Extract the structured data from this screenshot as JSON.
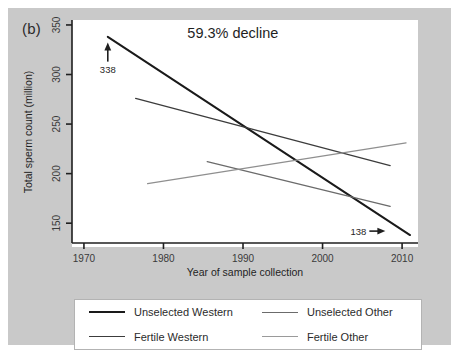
{
  "figure": {
    "panel_label": "(b)",
    "background_color": "#c9c9c9",
    "plot_background_color": "#ffffff"
  },
  "chart_data": {
    "type": "line",
    "title": "",
    "subtitle": "",
    "xlabel": "Year of sample collection",
    "ylabel": "Total sperm count (million)",
    "xlim": [
      1968.5,
      2012.0
    ],
    "ylim": [
      130,
      355
    ],
    "xticks": [
      1970,
      1980,
      1990,
      2000,
      2010
    ],
    "xtick_labels": [
      "1970",
      "1980",
      "1990",
      "2000",
      "2010"
    ],
    "yticks": [
      150,
      200,
      250,
      300,
      350
    ],
    "ytick_labels": [
      "150",
      "200",
      "250",
      "300",
      "350"
    ],
    "grid": false,
    "legend_position": "below-plot",
    "series": [
      {
        "name": "Unselected Western",
        "color": "#1a1a1a",
        "width": 2.0,
        "x": [
          1973.0,
          2011.0
        ],
        "y": [
          338,
          138
        ]
      },
      {
        "name": "Fertile Western",
        "color": "#3c3c3c",
        "width": 1.3,
        "x": [
          1976.5,
          2008.5
        ],
        "y": [
          276,
          208
        ]
      },
      {
        "name": "Unselected Other",
        "color": "#6b6b6b",
        "width": 1.3,
        "x": [
          1985.5,
          2008.5
        ],
        "y": [
          212,
          167
        ]
      },
      {
        "name": "Fertile Other",
        "color": "#8f8f8f",
        "width": 1.2,
        "x": [
          1978.0,
          2010.5
        ],
        "y": [
          190,
          231
        ]
      }
    ],
    "annotations": [
      {
        "name": "decline-annotation",
        "text": "59.3% decline",
        "x": 1983.0,
        "y": 337
      },
      {
        "name": "start-value-annotation",
        "text": "338",
        "x": 1973.0,
        "y": 311,
        "arrow": "up"
      },
      {
        "name": "end-value-annotation",
        "text": "138",
        "x": 2004.5,
        "y": 142,
        "arrow": "right"
      }
    ]
  },
  "legend": {
    "entries": [
      {
        "label": "Unselected Western",
        "color": "#1a1a1a",
        "thickness": "2.2px"
      },
      {
        "label": "Unselected Other",
        "color": "#6b6b6b",
        "thickness": "1.8px"
      },
      {
        "label": "Fertile Western",
        "color": "#3c3c3c",
        "thickness": "1.8px"
      },
      {
        "label": "Fertile Other",
        "color": "#9a9a9a",
        "thickness": "1.4px"
      }
    ]
  }
}
